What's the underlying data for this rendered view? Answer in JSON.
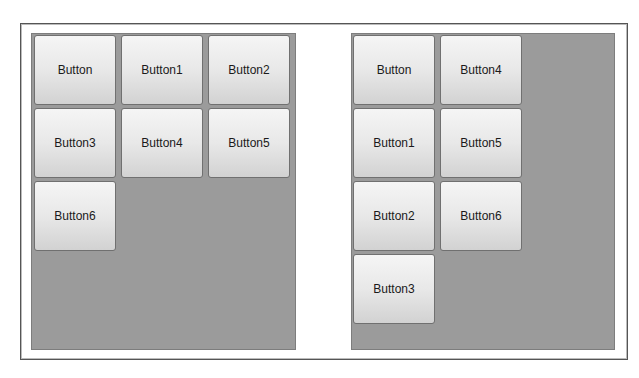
{
  "left_panel": {
    "layout": "wrap-horizontal",
    "buttons": [
      {
        "label": "Button"
      },
      {
        "label": "Button1"
      },
      {
        "label": "Button2"
      },
      {
        "label": "Button3"
      },
      {
        "label": "Button4"
      },
      {
        "label": "Button5"
      },
      {
        "label": "Button6"
      }
    ]
  },
  "right_panel": {
    "layout": "wrap-vertical",
    "buttons": [
      {
        "label": "Button"
      },
      {
        "label": "Button1"
      },
      {
        "label": "Button2"
      },
      {
        "label": "Button3"
      },
      {
        "label": "Button4"
      },
      {
        "label": "Button5"
      },
      {
        "label": "Button6"
      }
    ]
  },
  "colors": {
    "panel_bg": "#9b9b9b",
    "button_top": "#f5f5f5",
    "button_bottom": "#d2d2d2",
    "frame_border": "#555555"
  }
}
